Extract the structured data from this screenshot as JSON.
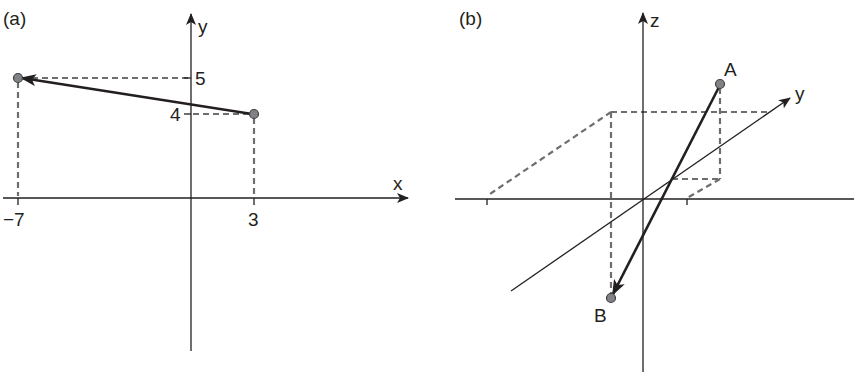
{
  "panel_a": {
    "label": "(a)",
    "x_axis_label": "x",
    "y_axis_label": "y",
    "x_ticks": [
      "−7",
      "3"
    ],
    "y_ticks": [
      "5",
      "4"
    ],
    "points": [
      {
        "name": "start",
        "x": 3,
        "y": 4
      },
      {
        "name": "end",
        "x": -7,
        "y": 5
      }
    ],
    "vector": "from (3, 4) to (−7, 5)"
  },
  "panel_b": {
    "label": "(b)",
    "z_axis_label": "z",
    "y_axis_label": "y",
    "point_a_label": "A",
    "point_b_label": "B",
    "vector": "from A to B"
  },
  "colors": {
    "axis": "#231f20",
    "dashed": "#6d6e70",
    "point_fill": "#808285"
  }
}
